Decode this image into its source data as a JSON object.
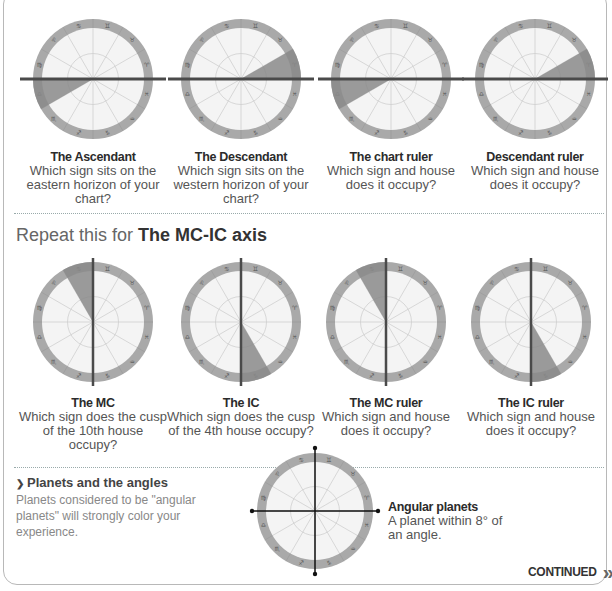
{
  "top_row": [
    {
      "title": "The Ascendant",
      "text": "Which sign sits on the eastern horizon of your chart?",
      "axis": "horizontal",
      "sector": [
        180,
        210
      ]
    },
    {
      "title": "The Descendant",
      "text": "Which sign sits on the western horizon of your chart?",
      "axis": "horizontal",
      "sector": [
        0,
        30
      ]
    },
    {
      "title": "The chart ruler",
      "text": "Which sign and house does it occupy?",
      "axis": "horizontal",
      "sector": [
        180,
        210
      ]
    },
    {
      "title": "Descendant ruler",
      "text": "Which sign and house does it occupy?",
      "axis": "horizontal",
      "sector": [
        0,
        30
      ]
    }
  ],
  "section": {
    "prefix": "Repeat this for ",
    "bold": "The MC-IC axis"
  },
  "bottom_row": [
    {
      "title": "The MC",
      "text": "Which sign does the cusp of the 10th house occupy?",
      "axis": "vertical",
      "sector": [
        90,
        120
      ]
    },
    {
      "title": "The IC",
      "text": "Which sign does the cusp of the 4th house occupy?",
      "axis": "vertical",
      "sector": [
        270,
        300
      ]
    },
    {
      "title": "The MC ruler",
      "text": "Which sign and house does it occupy?",
      "axis": "vertical",
      "sector": [
        90,
        120
      ]
    },
    {
      "title": "The IC ruler",
      "text": "Which sign and house does it occupy?",
      "axis": "vertical",
      "sector": [
        270,
        300
      ]
    }
  ],
  "planets": {
    "bullet": "❯",
    "heading": "Planets and the angles",
    "text": "Planets considered to be \"angular planets\" will strongly color your experience."
  },
  "angular": {
    "title": "Angular planets",
    "text": "A planet within 8° of an angle."
  },
  "continued": {
    "label": "CONTINUED",
    "icon": "»"
  },
  "zodiac_glyphs": [
    "♈",
    "♉",
    "♊",
    "♋",
    "♌",
    "♍",
    "♎",
    "♏",
    "♐",
    "♑",
    "♒",
    "♓"
  ],
  "colors": {
    "ring": "#a9a9a9",
    "face": "#f4f4f4",
    "sector": "#8a8a8a",
    "axis": "#4a4a4a",
    "spoke": "#cfcfcf"
  }
}
